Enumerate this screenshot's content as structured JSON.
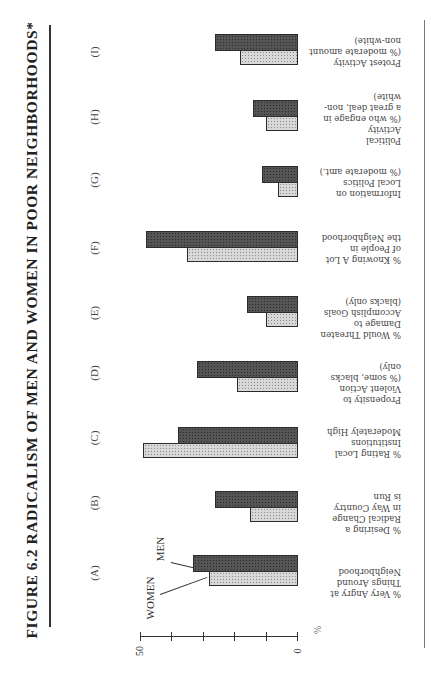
{
  "title": "FIGURE 6.2 RADICALISM OF MEN AND WOMEN IN POOR NEIGHBORHOODS*",
  "legend": {
    "women": "WOMEN",
    "men": "MEN"
  },
  "axis": {
    "min_label": "0",
    "max_label": "50",
    "unit": "%"
  },
  "colors": {
    "men": "#555555",
    "women": "#d8d8d8",
    "border": "#2b2b2b"
  },
  "groups": [
    {
      "letter": "(A)",
      "lines": [
        "% Very Angry at",
        "Things Around",
        "Neighborhood"
      ]
    },
    {
      "letter": "(B)",
      "lines": [
        "% Desiring a",
        "Radical Change",
        "in Way Country",
        "is Run"
      ]
    },
    {
      "letter": "(C)",
      "lines": [
        "% Rating Local",
        "Institutions",
        "Moderately High"
      ]
    },
    {
      "letter": "(D)",
      "lines": [
        "Propensity to",
        "Violent Action",
        "(% some, blacks",
        "only)"
      ]
    },
    {
      "letter": "(E)",
      "lines": [
        "% Would Threaten",
        "Damage to",
        "Accomplish Goals",
        "(blacks only)"
      ]
    },
    {
      "letter": "(F)",
      "lines": [
        "% Knowing A Lot",
        "of People in",
        "the Neighborhood"
      ]
    },
    {
      "letter": "(G)",
      "lines": [
        "Information on",
        "Local Politics",
        "(% moderate amt.)"
      ]
    },
    {
      "letter": "(H)",
      "lines": [
        "Political",
        "Activity",
        "(% who engage in",
        "a great deal, non-",
        "white)"
      ]
    },
    {
      "letter": "(I)",
      "lines": [
        "Protest Activity",
        "(% moderate amount",
        "non-white)"
      ]
    }
  ],
  "chart_data": {
    "type": "bar",
    "title": "FIGURE 6.2 RADICALISM OF MEN AND WOMEN IN POOR NEIGHBORHOODS*",
    "xlabel": "",
    "ylabel": "%",
    "ylim": [
      0,
      50
    ],
    "yticks": [
      0,
      10,
      20,
      30,
      40,
      50
    ],
    "tick_labels_shown": [
      "0",
      "50"
    ],
    "grid": false,
    "legend_position": "annotation on first group",
    "orientation": "vertical bars (page rotated 90°)",
    "categories": [
      "(A) % Very Angry at Things Around Neighborhood",
      "(B) % Desiring a Radical Change in Way Country is Run",
      "(C) % Rating Local Institutions Moderately High",
      "(D) Propensity to Violent Action (% some, blacks only)",
      "(E) % Would Threaten Damage to Accomplish Goals (blacks only)",
      "(F) % Knowing A Lot of People in the Neighborhood",
      "(G) Information on Local Politics (% moderate amt.)",
      "(H) Political Activity (% who engage in a great deal, non-white)",
      "(I) Protest Activity (% moderate amount non-white)"
    ],
    "series": [
      {
        "name": "WOMEN",
        "values": [
          28,
          15,
          49,
          19,
          10,
          35,
          6,
          10,
          18
        ]
      },
      {
        "name": "MEN",
        "values": [
          33,
          26,
          38,
          32,
          16,
          48,
          11,
          14,
          26
        ]
      }
    ]
  }
}
